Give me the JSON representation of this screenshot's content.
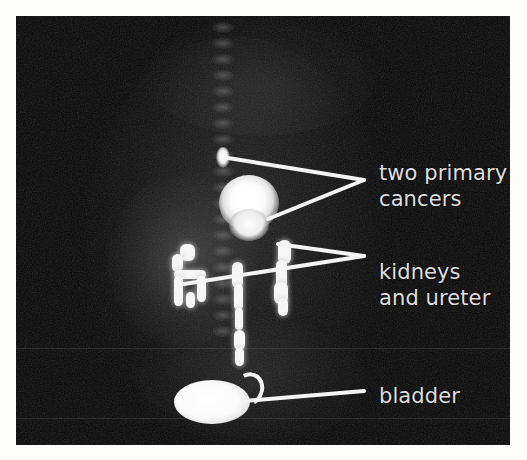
{
  "figure": {
    "modality": "PET scan",
    "view": "coronal whole-body",
    "background_color": "#060606",
    "paper_color": "#ffffff",
    "label_color": "#dedede",
    "uptake_color": "#ffffff",
    "ghost_top": "",
    "ghost_bottom": ""
  },
  "annotations": [
    {
      "id": "cancers",
      "label_line_1": "two primary",
      "label_line_2": "cancers",
      "target": "two focal areas of intense tracer uptake in the upper abdomen"
    },
    {
      "id": "kidneys",
      "label_line_1": "kidneys",
      "label_line_2": "and ureter",
      "target": "bilateral renal uptake with descending ureter"
    },
    {
      "id": "bladder",
      "label_line_1": "bladder",
      "label_line_2": "",
      "target": "urinary bladder tracer accumulation in the pelvis"
    }
  ],
  "icons": {
    "leader_line": "leader-line",
    "scan_plate": "scan-image"
  }
}
